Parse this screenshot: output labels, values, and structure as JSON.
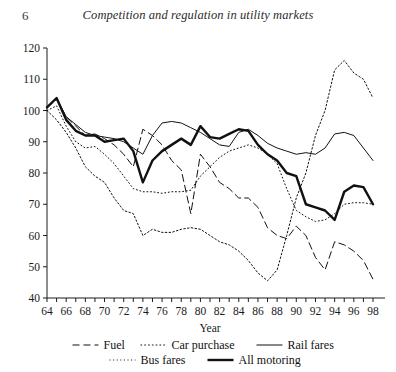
{
  "page": {
    "folio": "6",
    "running_title": "Competition and regulation in utility markets"
  },
  "chart_data": {
    "type": "line",
    "title": "",
    "xlabel": "Year",
    "ylabel": "",
    "xlim": [
      64,
      98
    ],
    "ylim": [
      40,
      120
    ],
    "ytick_step": 10,
    "yticks": [
      40,
      50,
      60,
      70,
      80,
      90,
      100,
      110,
      120
    ],
    "xticks": [
      64,
      65,
      66,
      67,
      68,
      69,
      70,
      71,
      72,
      73,
      74,
      75,
      76,
      77,
      78,
      79,
      80,
      81,
      82,
      83,
      84,
      85,
      86,
      87,
      88,
      89,
      90,
      91,
      92,
      93,
      94,
      95,
      96,
      97,
      98
    ],
    "xtick_labels": [
      "64",
      "",
      "66",
      "",
      "68",
      "",
      "70",
      "",
      "72",
      "",
      "74",
      "",
      "76",
      "",
      "78",
      "",
      "80",
      "",
      "82",
      "",
      "84",
      "",
      "86",
      "",
      "88",
      "",
      "90",
      "",
      "92",
      "",
      "94",
      "",
      "96",
      "",
      "98"
    ],
    "grid": false,
    "legend_position": "bottom",
    "x": [
      64,
      65,
      66,
      67,
      68,
      69,
      70,
      71,
      72,
      73,
      74,
      75,
      76,
      77,
      78,
      79,
      80,
      81,
      82,
      83,
      84,
      85,
      86,
      87,
      88,
      89,
      90,
      91,
      92,
      93,
      94,
      95,
      96,
      97,
      98
    ],
    "series": [
      {
        "name": "Fuel",
        "style": "dashed",
        "width": 1,
        "color": "#111111",
        "values": [
          101,
          103.5,
          98,
          95,
          92,
          92.5,
          91,
          89,
          86,
          82,
          94,
          92,
          89,
          84,
          81,
          67,
          86,
          82,
          77,
          75,
          72,
          72,
          69,
          62.5,
          60,
          59,
          63,
          60,
          53,
          49,
          58,
          57,
          55,
          52,
          46
        ]
      },
      {
        "name": "Car purchase",
        "style": "dotted",
        "width": 1,
        "color": "#111111",
        "values": [
          100,
          97,
          93,
          88,
          82,
          79,
          77,
          72,
          68,
          67,
          60,
          62,
          61,
          61,
          62,
          62.5,
          62,
          60,
          58,
          57,
          55,
          52,
          48,
          45.5,
          49,
          60,
          72,
          80,
          92,
          100,
          113,
          116,
          112,
          110,
          104
        ]
      },
      {
        "name": "Rail fares",
        "style": "solid",
        "width": 1,
        "color": "#111111",
        "values": [
          101,
          104,
          98,
          95.5,
          93,
          92,
          91.5,
          91,
          90,
          88,
          86,
          92,
          96,
          96.5,
          96,
          94.5,
          93,
          91,
          89,
          88.5,
          93,
          94,
          92,
          89.5,
          88,
          87,
          86,
          86.5,
          86,
          88,
          92.5,
          93,
          92,
          88,
          84
        ]
      },
      {
        "name": "Bus fares",
        "style": "finedot",
        "width": 1,
        "color": "#111111",
        "values": [
          100,
          101.5,
          95,
          90,
          88,
          88.5,
          86,
          83,
          79,
          75,
          74,
          74,
          73.5,
          74,
          74,
          74.5,
          79,
          82,
          85,
          87,
          88,
          89,
          88,
          86,
          83,
          75,
          68,
          66,
          64.5,
          65,
          67,
          70,
          70.5,
          70.5,
          70
        ]
      },
      {
        "name": "All motoring",
        "style": "thick",
        "width": 2.4,
        "color": "#111111",
        "values": [
          101,
          104,
          97,
          93.5,
          92,
          92,
          90,
          90.5,
          91,
          87,
          77,
          84,
          87,
          89,
          91,
          89,
          95,
          91.5,
          91,
          92.5,
          94,
          93.5,
          89,
          86,
          84,
          80,
          79,
          70,
          69,
          68,
          65,
          74,
          76,
          75.5,
          70
        ]
      }
    ],
    "legend": [
      {
        "label": "Fuel",
        "style": "dashed"
      },
      {
        "label": "Car purchase",
        "style": "dotted"
      },
      {
        "label": "Rail fares",
        "style": "solid"
      },
      {
        "label": "Bus fares",
        "style": "finedot"
      },
      {
        "label": "All motoring",
        "style": "thick"
      }
    ]
  }
}
